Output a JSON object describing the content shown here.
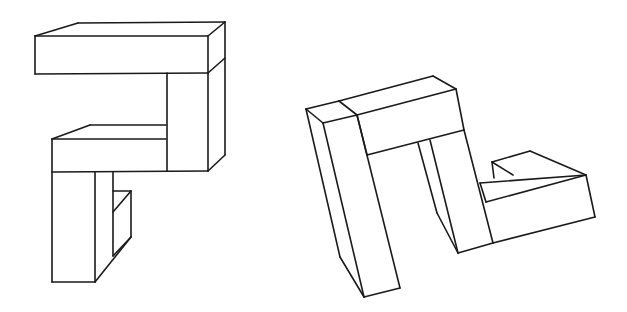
{
  "diagram": {
    "type": "mental-rotation-pair",
    "background": "#ffffff",
    "line_color": "#1a1a1a",
    "figures": [
      {
        "id": "figure-left",
        "description": "3D block object composed of cubes in isometric line drawing",
        "edges": [
          [
            [
              35,
              36
            ],
            [
              208,
              36
            ]
          ],
          [
            [
              35,
              36
            ],
            [
              78,
              23
            ]
          ],
          [
            [
              78,
              23
            ],
            [
              225,
              22
            ]
          ],
          [
            [
              208,
              36
            ],
            [
              225,
              22
            ]
          ],
          [
            [
              35,
              36
            ],
            [
              35,
              74
            ]
          ],
          [
            [
              35,
              74
            ],
            [
              208,
              73
            ]
          ],
          [
            [
              208,
              36
            ],
            [
              208,
              73
            ]
          ],
          [
            [
              208,
              73
            ],
            [
              225,
              58
            ]
          ],
          [
            [
              225,
              22
            ],
            [
              225,
              155
            ]
          ],
          [
            [
              167,
              73
            ],
            [
              167,
              171
            ]
          ],
          [
            [
              208,
              73
            ],
            [
              208,
              171
            ]
          ],
          [
            [
              208,
              171
            ],
            [
              225,
              155
            ]
          ],
          [
            [
              52,
              139
            ],
            [
              166,
              139
            ]
          ],
          [
            [
              52,
              139
            ],
            [
              90,
              125
            ]
          ],
          [
            [
              90,
              125
            ],
            [
              166,
              125
            ]
          ],
          [
            [
              52,
              139
            ],
            [
              52,
              282
            ]
          ],
          [
            [
              52,
              172
            ],
            [
              208,
              171
            ]
          ],
          [
            [
              52,
              282
            ],
            [
              95,
              282
            ]
          ],
          [
            [
              95,
              172
            ],
            [
              95,
              282
            ]
          ],
          [
            [
              113,
              172
            ],
            [
              113,
              256
            ]
          ],
          [
            [
              95,
              282
            ],
            [
              131,
              237
            ]
          ],
          [
            [
              113,
              191
            ],
            [
              131,
              191
            ]
          ],
          [
            [
              131,
              191
            ],
            [
              131,
              237
            ]
          ],
          [
            [
              113,
              212
            ],
            [
              131,
              191
            ]
          ],
          [
            [
              113,
              256
            ],
            [
              131,
              237
            ]
          ]
        ]
      },
      {
        "id": "figure-right",
        "description": "Same block object rotated, possibly mirrored",
        "edges": [
          [
            [
              306,
              109
            ],
            [
              339,
              101
            ]
          ],
          [
            [
              339,
              101
            ],
            [
              433,
              76
            ]
          ],
          [
            [
              433,
              76
            ],
            [
              456,
              89
            ]
          ],
          [
            [
              306,
              109
            ],
            [
              323,
              123
            ]
          ],
          [
            [
              323,
              123
            ],
            [
              357,
              115
            ]
          ],
          [
            [
              339,
              101
            ],
            [
              357,
              115
            ]
          ],
          [
            [
              357,
              115
            ],
            [
              456,
              89
            ]
          ],
          [
            [
              456,
              89
            ],
            [
              464,
              130
            ]
          ],
          [
            [
              367,
              155
            ],
            [
              464,
              130
            ]
          ],
          [
            [
              357,
              115
            ],
            [
              367,
              155
            ]
          ],
          [
            [
              306,
              109
            ],
            [
              340,
              257
            ]
          ],
          [
            [
              340,
              257
            ],
            [
              364,
              297
            ]
          ],
          [
            [
              323,
              123
            ],
            [
              364,
              297
            ]
          ],
          [
            [
              357,
              115
            ],
            [
              400,
              288
            ]
          ],
          [
            [
              364,
              297
            ],
            [
              400,
              288
            ]
          ],
          [
            [
              418,
              143
            ],
            [
              437,
              213
            ]
          ],
          [
            [
              430,
              140
            ],
            [
              458,
              253
            ]
          ],
          [
            [
              437,
              213
            ],
            [
              458,
              253
            ]
          ],
          [
            [
              464,
              130
            ],
            [
              493,
              243
            ]
          ],
          [
            [
              458,
              253
            ],
            [
              493,
              243
            ]
          ],
          [
            [
              493,
              243
            ],
            [
              595,
              217
            ]
          ],
          [
            [
              480,
              183
            ],
            [
              586,
              175
            ]
          ],
          [
            [
              486,
              202
            ],
            [
              586,
              175
            ]
          ],
          [
            [
              480,
              183
            ],
            [
              486,
              202
            ]
          ],
          [
            [
              492,
              162
            ],
            [
              530,
              151
            ]
          ],
          [
            [
              530,
              151
            ],
            [
              586,
              175
            ]
          ],
          [
            [
              492,
              162
            ],
            [
              494,
              178
            ]
          ],
          [
            [
              492,
              162
            ],
            [
              513,
              175
            ]
          ],
          [
            [
              586,
              175
            ],
            [
              595,
              217
            ]
          ]
        ]
      }
    ]
  }
}
